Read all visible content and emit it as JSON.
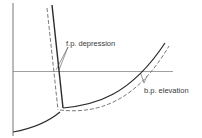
{
  "diagram": {
    "type": "phase-diagram",
    "labels": {
      "fp": "f.p. depression",
      "bp": "b.p. elevation"
    },
    "colors": {
      "solvent_line": "#2a2a2a",
      "solution_line": "#6a6a6a",
      "axis": "#777777",
      "pressure_line": "#888888",
      "text": "#3a3a3a"
    }
  }
}
